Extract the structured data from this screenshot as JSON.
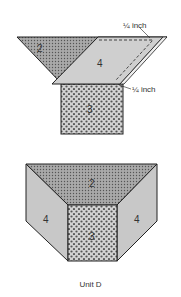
{
  "diagram": {
    "top_assembly": {
      "pieces": [
        {
          "id": "2",
          "label": "2",
          "shape": "triangle",
          "fill": "dense-dot"
        },
        {
          "id": "4",
          "label": "4",
          "shape": "parallelogram",
          "fill": "#cfcfcf"
        },
        {
          "id": "3",
          "label": "3",
          "shape": "square",
          "fill": "polka-dot"
        }
      ],
      "annotations": [
        {
          "text": "¼ inch",
          "position": "top-right"
        },
        {
          "text": "¼ inch",
          "position": "right-middle"
        }
      ]
    },
    "bottom_assembly": {
      "pieces": [
        {
          "id": "2",
          "label": "2"
        },
        {
          "id": "4-left",
          "label": "4"
        },
        {
          "id": "3",
          "label": "3"
        },
        {
          "id": "4-right",
          "label": "4"
        }
      ],
      "caption": "Unit D"
    },
    "colors": {
      "outline": "#222222",
      "gray_fill": "#c8c8c8",
      "dot_bg": "#bdbdbd",
      "dot": "#555555"
    }
  }
}
